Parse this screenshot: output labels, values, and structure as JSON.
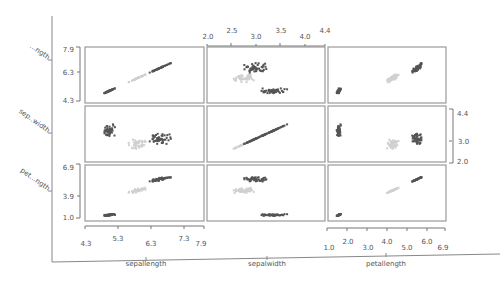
{
  "chart_data": {
    "type": "scatter",
    "title": "",
    "subtype": "scatterplot-matrix",
    "variables": [
      "sepallength",
      "sepalwidth",
      "petallength"
    ],
    "row_labels": [
      "...ngth",
      "sep..width",
      "pet...ngth"
    ],
    "column_labels": [
      "sepallength",
      "sepalwidth",
      "petallength"
    ],
    "axes": {
      "sepallength": {
        "range": [
          4.3,
          7.9
        ],
        "ticks": [
          "4.3",
          "5.3",
          "6.3",
          "7.3",
          "7.9"
        ],
        "left_ticks": [
          "4.3",
          "6.3",
          "7.9"
        ]
      },
      "sepalwidth": {
        "range": [
          2.0,
          4.4
        ],
        "ticks": [
          "2.0",
          "2.5",
          "3.0",
          "3.5",
          "4.0",
          "4.4"
        ],
        "right_ticks": [
          "2.0",
          "3.0",
          "4.4"
        ]
      },
      "petallength": {
        "range": [
          1.0,
          6.9
        ],
        "ticks": [
          "1.0",
          "2.0",
          "3.0",
          "4.0",
          "5.0",
          "6.0",
          "6.9"
        ],
        "left_ticks": [
          "1.0",
          "3.9",
          "6.9"
        ]
      }
    },
    "grid": false,
    "legend": "none",
    "point_color": "#555555",
    "point_color_faded": "#d0d0d0",
    "panel_border": "#9a9a9a"
  },
  "labels": {
    "row0": "...ngth",
    "row1": "sep..width",
    "row2": "pet...ngth",
    "col0": "sepallength",
    "col1": "sepalwidth",
    "col2": "petallength"
  }
}
